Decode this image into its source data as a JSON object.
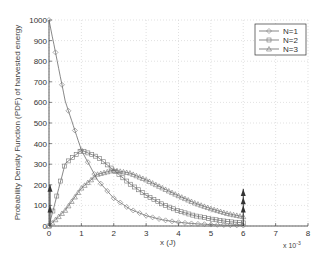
{
  "chart_data": {
    "type": "line",
    "title": "",
    "xlabel": "x (J)",
    "x_multiplier_label": "x 10",
    "x_multiplier_exponent": "-3",
    "ylabel": "Probability Density Function (PDF) of harvested energy",
    "xlim": [
      0,
      8
    ],
    "ylim": [
      0,
      1000
    ],
    "x_ticks": [
      "0",
      "1",
      "2",
      "3",
      "4",
      "5",
      "6",
      "7",
      "8"
    ],
    "y_ticks": [
      "0",
      "100",
      "200",
      "300",
      "400",
      "500",
      "600",
      "700",
      "800",
      "900",
      "1000"
    ],
    "grid": true,
    "legend_position": "upper right",
    "x": [
      0,
      0.5,
      1,
      1.5,
      2,
      2.5,
      3,
      3.5,
      4,
      4.5,
      5,
      5.5,
      6
    ],
    "series": [
      {
        "name": "N=1",
        "marker": "diamond",
        "values": [
          1000,
          607,
          368,
          223,
          135,
          82,
          50,
          30,
          18,
          11,
          7,
          4,
          2.5
        ]
      },
      {
        "name": "N=2",
        "marker": "square",
        "values": [
          0,
          303,
          368,
          335,
          271,
          205,
          149,
          106,
          73,
          50,
          34,
          22,
          15
        ]
      },
      {
        "name": "N=3",
        "marker": "triangle",
        "values": [
          0,
          76,
          184,
          251,
          271,
          257,
          224,
          185,
          147,
          112,
          84,
          61,
          45
        ]
      }
    ],
    "impulses": [
      {
        "x": 0,
        "heights": [
          100,
          200
        ],
        "label": "delta at x=0"
      },
      {
        "x": 6,
        "heights": [
          100,
          140,
          180
        ],
        "label": "delta at x=6"
      }
    ]
  },
  "labels": {
    "ylabel": "Probability Density Function (PDF) of harvested energy",
    "xlabel": "x (J)",
    "xexp_base": "x 10",
    "xexp_pow": "-3"
  }
}
